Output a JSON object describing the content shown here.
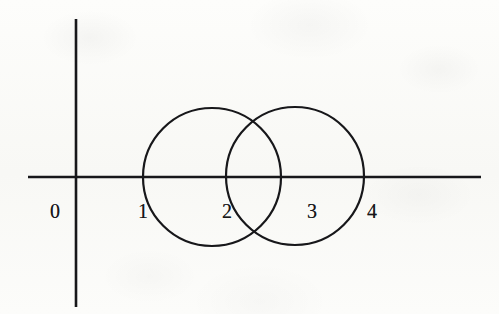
{
  "figure": {
    "title": "",
    "background_color": "#fbfbf9",
    "ink_color": "#17171a",
    "axes": {
      "x_axis": {
        "name": "x-axis",
        "y": 177,
        "x_start": 28,
        "x_end": 481
      },
      "y_axis": {
        "name": "y-axis",
        "x": 76,
        "y_start": 19,
        "y_end": 307
      },
      "origin": {
        "x": 76,
        "y": 177
      }
    },
    "tick_labels": [
      {
        "text": "0",
        "x": 55,
        "y": 211
      },
      {
        "text": "1",
        "x": 143,
        "y": 211
      },
      {
        "text": "2",
        "x": 227,
        "y": 211
      },
      {
        "text": "3",
        "x": 312,
        "y": 211
      },
      {
        "text": "4",
        "x": 372,
        "y": 211
      }
    ],
    "circles": [
      {
        "name": "left-circle",
        "cx": 212,
        "cy": 177,
        "r": 69,
        "stroke": "#17171a",
        "stroke_width": 2.2,
        "fill": "none"
      },
      {
        "name": "right-circle",
        "cx": 295,
        "cy": 176,
        "r": 69,
        "stroke": "#17171a",
        "stroke_width": 2.2,
        "fill": "none"
      }
    ]
  },
  "chart_data": {
    "type": "diagram",
    "title": "",
    "xlabel": "",
    "ylabel": "",
    "axis_tick_values": [
      0,
      1,
      2,
      3,
      4
    ],
    "axis_tick_pixel_x": [
      55,
      143,
      227,
      312,
      372
    ],
    "shapes": [
      {
        "kind": "circle",
        "label": "left circle",
        "center_units": [
          2,
          0
        ],
        "radius_units": 1,
        "x_intercepts_units": [
          1,
          3
        ],
        "center_px": [
          212,
          177
        ],
        "radius_px": 69
      },
      {
        "kind": "circle",
        "label": "right circle",
        "center_units": [
          3,
          0
        ],
        "radius_units": 1,
        "x_intercepts_units": [
          2,
          4
        ],
        "center_px": [
          295,
          176
        ],
        "radius_px": 69
      }
    ],
    "grid": false,
    "legend": null
  }
}
